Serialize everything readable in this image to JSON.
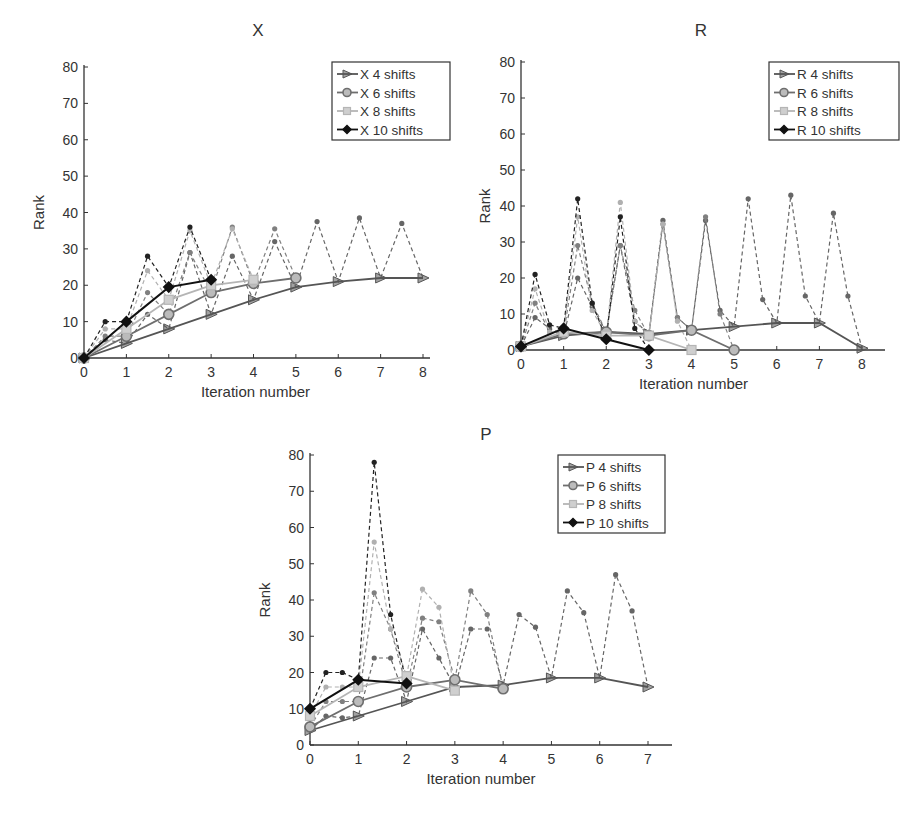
{
  "chart_data": [
    {
      "type": "line",
      "title": "X",
      "xlabel": "Iteration number",
      "ylabel": "Rank",
      "xlim": [
        0,
        8
      ],
      "ylim": [
        0,
        80
      ],
      "xticks": [
        "0",
        "1",
        "2",
        "3",
        "4",
        "5",
        "6",
        "7",
        "8"
      ],
      "yticks": [
        "0",
        "10",
        "20",
        "30",
        "40",
        "50",
        "60",
        "70",
        "80"
      ],
      "legend_position": "upper right",
      "grid": false,
      "series": [
        {
          "name": "X 4 shifts",
          "marker": "triangle-right",
          "color": "#555555",
          "x": [
            0,
            1,
            2,
            3,
            4,
            5,
            6,
            7,
            8
          ],
          "y": [
            0,
            4,
            8,
            12,
            16,
            19.5,
            21,
            22,
            22
          ]
        },
        {
          "name": "X 6 shifts",
          "marker": "circle",
          "color": "#6e6e6e",
          "x": [
            0,
            1,
            2,
            3,
            4,
            5
          ],
          "y": [
            0,
            6,
            12,
            18,
            20.5,
            22
          ]
        },
        {
          "name": "X 8 shifts",
          "marker": "square",
          "color": "#b5b5b5",
          "x": [
            0,
            1,
            2,
            3,
            4
          ],
          "y": [
            0,
            8,
            16,
            20,
            21.5
          ]
        },
        {
          "name": "X 10 shifts",
          "marker": "diamond",
          "color": "#111111",
          "x": [
            0,
            1,
            2,
            3
          ],
          "y": [
            0,
            10,
            19.5,
            21.5
          ]
        }
      ],
      "intermediate_dashed": [
        {
          "series": "X 4 shifts",
          "color": "#666666",
          "x": [
            0,
            0.5,
            1,
            1.5,
            2,
            2.5,
            3,
            3.5,
            4,
            4.5,
            5,
            5.5,
            6,
            6.5,
            7,
            7.5,
            8
          ],
          "y": [
            0,
            5,
            4,
            12,
            8,
            29,
            12,
            28,
            16,
            32,
            19.5,
            37.5,
            21,
            38.5,
            22,
            37,
            22
          ]
        },
        {
          "series": "X 6 shifts",
          "color": "#808080",
          "x": [
            0,
            0.5,
            1,
            1.5,
            2,
            2.5,
            3,
            3.5,
            4,
            4.5,
            5
          ],
          "y": [
            0,
            6,
            6,
            18,
            12,
            29,
            18,
            36,
            20.5,
            35.5,
            22
          ]
        },
        {
          "series": "X 8 shifts",
          "color": "#b0b0b0",
          "x": [
            0,
            0.5,
            1,
            1.5,
            2,
            2.5,
            3,
            3.5,
            4
          ],
          "y": [
            0,
            8,
            8,
            24,
            16,
            35,
            20,
            35.5,
            21.5
          ]
        },
        {
          "series": "X 10 shifts",
          "color": "#222222",
          "x": [
            0,
            0.5,
            1,
            1.5,
            2,
            2.5,
            3
          ],
          "y": [
            0,
            10,
            10,
            28,
            19.5,
            36,
            21.5
          ]
        }
      ]
    },
    {
      "type": "line",
      "title": "R",
      "xlabel": "Iteration number",
      "ylabel": "Rank",
      "xlim": [
        0,
        8
      ],
      "ylim": [
        0,
        80
      ],
      "xticks": [
        "0",
        "1",
        "2",
        "3",
        "4",
        "5",
        "6",
        "7",
        "8"
      ],
      "yticks": [
        "0",
        "10",
        "20",
        "30",
        "40",
        "50",
        "60",
        "70",
        "80"
      ],
      "legend_position": "upper right",
      "grid": false,
      "series": [
        {
          "name": "R 4 shifts",
          "marker": "triangle-right",
          "color": "#555555",
          "x": [
            0,
            1,
            2,
            3,
            4,
            5,
            6,
            7,
            8
          ],
          "y": [
            1,
            4,
            5,
            4.5,
            5.5,
            6.5,
            7.5,
            7.5,
            0.5
          ]
        },
        {
          "name": "R 6 shifts",
          "marker": "circle",
          "color": "#6e6e6e",
          "x": [
            0,
            1,
            2,
            3,
            4,
            5
          ],
          "y": [
            1,
            4.5,
            5,
            4,
            5.5,
            0
          ]
        },
        {
          "name": "R 8 shifts",
          "marker": "square",
          "color": "#b5b5b5",
          "x": [
            0,
            1,
            2,
            3,
            4
          ],
          "y": [
            1,
            5,
            4,
            4,
            0
          ]
        },
        {
          "name": "R 10 shifts",
          "marker": "diamond",
          "color": "#111111",
          "x": [
            0,
            1,
            2,
            3
          ],
          "y": [
            1,
            6,
            3,
            0
          ]
        }
      ],
      "intermediate_dashed": [
        {
          "series": "R 4 shifts",
          "color": "#666666",
          "x": [
            0,
            0.33,
            0.67,
            1,
            1.33,
            1.67,
            2,
            2.33,
            2.67,
            3,
            3.33,
            3.67,
            4,
            4.33,
            4.67,
            5,
            5.33,
            5.67,
            6,
            6.33,
            6.67,
            7,
            7.33,
            7.67,
            8
          ],
          "y": [
            1,
            9,
            6,
            4,
            20,
            12,
            5,
            29,
            8,
            4.5,
            36,
            9,
            5.5,
            36,
            11,
            6.5,
            42,
            14,
            7.5,
            43,
            15,
            7.5,
            38,
            15,
            0.5
          ]
        },
        {
          "series": "R 6 shifts",
          "color": "#808080",
          "x": [
            0,
            0.33,
            0.67,
            1,
            1.33,
            1.67,
            2,
            2.33,
            2.67,
            3,
            3.33,
            3.67,
            4,
            4.33,
            4.67,
            5
          ],
          "y": [
            1,
            13,
            5,
            4.5,
            29,
            13,
            5,
            29,
            11,
            4,
            35,
            9,
            5.5,
            37,
            10,
            0
          ]
        },
        {
          "series": "R 8 shifts",
          "color": "#b0b0b0",
          "x": [
            0,
            0.33,
            0.67,
            1,
            1.33,
            1.67,
            2,
            2.33,
            2.67,
            3,
            3.33,
            3.67,
            4
          ],
          "y": [
            1,
            17,
            5,
            5,
            37,
            11,
            4,
            41,
            8,
            4,
            35,
            8,
            0
          ]
        },
        {
          "series": "R 10 shifts",
          "color": "#222222",
          "x": [
            0,
            0.33,
            0.67,
            1,
            1.33,
            1.67,
            2,
            2.33,
            2.67,
            3
          ],
          "y": [
            1,
            21,
            7,
            6,
            42,
            13,
            3,
            37,
            6,
            0
          ]
        }
      ]
    },
    {
      "type": "line",
      "title": "P",
      "xlabel": "Iteration number",
      "ylabel": "Rank",
      "xlim": [
        0,
        7
      ],
      "ylim": [
        0,
        80
      ],
      "xticks": [
        "0",
        "1",
        "2",
        "3",
        "4",
        "5",
        "6",
        "7"
      ],
      "yticks": [
        "0",
        "10",
        "20",
        "30",
        "40",
        "50",
        "60",
        "70",
        "80"
      ],
      "legend_position": "upper right",
      "grid": false,
      "series": [
        {
          "name": "P 4 shifts",
          "marker": "triangle-right",
          "color": "#555555",
          "x": [
            0,
            1,
            2,
            3,
            4,
            5,
            6,
            7
          ],
          "y": [
            4,
            8,
            12,
            16,
            16.5,
            18.5,
            18.5,
            16
          ]
        },
        {
          "name": "P 6 shifts",
          "marker": "circle",
          "color": "#6e6e6e",
          "x": [
            0,
            1,
            2,
            3,
            4
          ],
          "y": [
            5,
            12,
            16,
            18,
            15.5
          ]
        },
        {
          "name": "P 8 shifts",
          "marker": "square",
          "color": "#b5b5b5",
          "x": [
            0,
            1,
            2,
            3
          ],
          "y": [
            8,
            16,
            19,
            15
          ]
        },
        {
          "name": "P 10 shifts",
          "marker": "diamond",
          "color": "#111111",
          "x": [
            0,
            1,
            2
          ],
          "y": [
            10,
            18,
            17
          ]
        }
      ],
      "intermediate_dashed": [
        {
          "series": "P 4 shifts",
          "color": "#666666",
          "x": [
            0,
            0.33,
            0.67,
            1,
            1.33,
            1.67,
            2,
            2.33,
            2.67,
            3,
            3.33,
            3.67,
            4,
            4.33,
            4.67,
            5,
            5.33,
            5.67,
            6,
            6.33,
            6.67,
            7
          ],
          "y": [
            4,
            8,
            7.5,
            8,
            24,
            24,
            12,
            32,
            24,
            16,
            32,
            32,
            16.5,
            36,
            32.5,
            18.5,
            42.5,
            36.5,
            18.5,
            47,
            37,
            16
          ]
        },
        {
          "series": "P 6 shifts",
          "color": "#808080",
          "x": [
            0,
            0.33,
            0.67,
            1,
            1.33,
            1.67,
            2,
            2.33,
            2.67,
            3,
            3.33,
            3.67,
            4
          ],
          "y": [
            5,
            12,
            12,
            12,
            42,
            32,
            16,
            35,
            34,
            18,
            42.5,
            36,
            15.5
          ]
        },
        {
          "series": "P 8 shifts",
          "color": "#b0b0b0",
          "x": [
            0,
            0.33,
            0.67,
            1,
            1.33,
            1.67,
            2,
            2.33,
            2.67,
            3
          ],
          "y": [
            8,
            16,
            16,
            16,
            56,
            32,
            19,
            43,
            38,
            15
          ]
        },
        {
          "series": "P 10 shifts",
          "color": "#222222",
          "x": [
            0,
            0.33,
            0.67,
            1,
            1.33,
            1.67,
            2
          ],
          "y": [
            10,
            20,
            20,
            18,
            78,
            36,
            17
          ]
        }
      ]
    }
  ],
  "panels": [
    {
      "title": "X",
      "xlabel": "Iteration number",
      "ylabel": "Rank",
      "legend": [
        "X 4 shifts",
        "X 6 shifts",
        "X 8 shifts",
        "X 10 shifts"
      ]
    },
    {
      "title": "R",
      "xlabel": "Iteration number",
      "ylabel": "Rank",
      "legend": [
        "R 4 shifts",
        "R 6 shifts",
        "R 8 shifts",
        "R 10 shifts"
      ]
    },
    {
      "title": "P",
      "xlabel": "Iteration number",
      "ylabel": "Rank",
      "legend": [
        "P 4 shifts",
        "P 6 shifts",
        "P 8 shifts",
        "P 10 shifts"
      ]
    }
  ]
}
